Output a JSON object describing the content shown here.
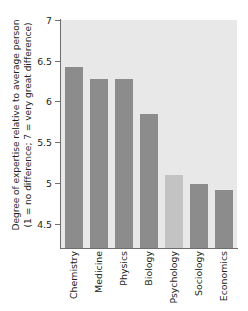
{
  "chart_data": {
    "type": "bar",
    "title": "",
    "xlabel": "",
    "ylabel": "Degree of expertise relative to average person (1 = no difference; 7 = very great difference)",
    "ylabel_line1": "Degree of expertise relative to average person",
    "ylabel_line2": "(1 = no difference; 7 = very great difference)",
    "categories": [
      "Chemistry",
      "Medicine",
      "Physics",
      "Biology",
      "Psychology",
      "Sociology",
      "Economics"
    ],
    "values": [
      6.42,
      6.28,
      6.28,
      5.85,
      5.1,
      4.98,
      4.91
    ],
    "ylim": [
      4.2,
      7
    ],
    "yticks": [
      7,
      6.5,
      6,
      5.5,
      5,
      4.5
    ],
    "ytick_labels": [
      "7",
      "6.5",
      "6",
      "5.5",
      "5",
      "4.5"
    ],
    "grid": false,
    "legend": "none",
    "bar_colors": [
      "#8c8c8c",
      "#8c8c8c",
      "#8c8c8c",
      "#8c8c8c",
      "#c3c3c3",
      "#8c8c8c",
      "#8c8c8c"
    ],
    "plot_background": "#e8e8e8",
    "axis_color": "#6e6e6e",
    "text_color": "#231f20"
  }
}
